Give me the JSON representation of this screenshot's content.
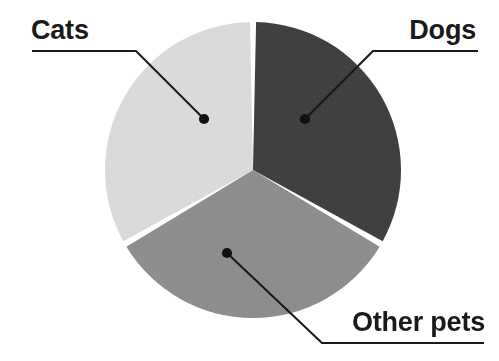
{
  "figure": {
    "background_color": "#ffffff",
    "width": 499,
    "height": 361
  },
  "chart_data": {
    "type": "pie",
    "title": "",
    "subtitle": "",
    "xlabel": "",
    "ylabel": "",
    "legend_position": "none",
    "labels_position": "callout-leader-lines",
    "grid": false,
    "categories": [
      "Dogs",
      "Other pets",
      "Cats"
    ],
    "values": [
      33.3,
      33.3,
      33.3
    ],
    "unit": "percent",
    "slices": [
      {
        "label": "Dogs",
        "value": 33.3,
        "angle_degrees": 120,
        "start_angle_degrees": 0,
        "end_angle_degrees": 120,
        "color": "#3a3a3a",
        "label_x": 476,
        "label_y": 30,
        "dot_x": 305,
        "dot_y": 119
      },
      {
        "label": "Other pets",
        "value": 33.3,
        "angle_degrees": 120,
        "start_angle_degrees": 120,
        "end_angle_degrees": 240,
        "color": "#8c8c8c",
        "label_x": 485,
        "label_y": 322,
        "dot_x": 227,
        "dot_y": 253
      },
      {
        "label": "Cats",
        "value": 33.3,
        "angle_degrees": 120,
        "start_angle_degrees": 240,
        "end_angle_degrees": 360,
        "color": "#dcdcdc",
        "label_x": 31,
        "label_y": 30,
        "dot_x": 204,
        "dot_y": 119
      }
    ],
    "geometry": {
      "center_x": 253,
      "center_y": 170,
      "radius": 148,
      "slice_gap_degrees": 2.4,
      "start_angle_degrees": 0,
      "direction": "clockwise"
    },
    "colors": {
      "dogs": "#3a3a3a",
      "other_pets": "#8c8c8c",
      "cats": "#dcdcdc",
      "leader_line": "#1a1a1a",
      "label_text": "#1a1a1a",
      "background": "#ffffff"
    }
  },
  "labels": {
    "cats": "Cats",
    "dogs": "Dogs",
    "other_pets": "Other pets"
  },
  "leaders": {
    "cats": {
      "underline_start_x": 32,
      "underline_end_x": 136,
      "underline_y": 51,
      "dot_x": 204,
      "dot_y": 119
    },
    "dogs": {
      "underline_start_x": 478,
      "underline_end_x": 373,
      "underline_y": 51,
      "dot_x": 305,
      "dot_y": 119
    },
    "other_pets": {
      "underline_start_x": 484,
      "underline_end_x": 322,
      "underline_y": 343,
      "dot_x": 227,
      "dot_y": 253
    }
  }
}
